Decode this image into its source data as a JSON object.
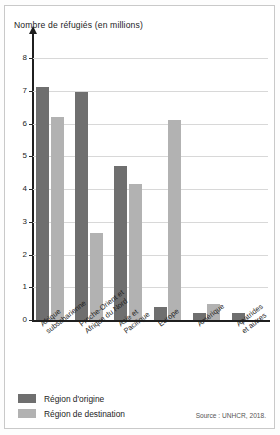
{
  "figure": {
    "source_note": "Source : UNHCR, 2018."
  },
  "legend": {
    "items": [
      {
        "label": "Région d'origine",
        "color": "#6f6f6f",
        "key": "origin"
      },
      {
        "label": "Région de destination",
        "color": "#b2b2b2",
        "key": "destination"
      }
    ]
  },
  "chart_data": {
    "type": "bar",
    "title": "Nombre de réfugiés (en millions)",
    "xlabel": "",
    "ylabel": "Nombre de réfugiés (en millions)",
    "ylim": [
      0,
      8
    ],
    "yticks": [
      0,
      1,
      2,
      3,
      4,
      5,
      6,
      7,
      8
    ],
    "ytick_labels": [
      "0",
      "1",
      "2",
      "3",
      "4",
      "5",
      "6",
      "7",
      "8"
    ],
    "grid": true,
    "legend_position": "bottom-left",
    "categories": [
      "Afrique subsaharienne",
      "Proche-Orient et Afrique du Nord",
      "Asie et Pacifique",
      "Europe",
      "Amérique",
      "Apatrides et autres"
    ],
    "category_lines": [
      [
        "Afrique",
        "subsaharienne"
      ],
      [
        "Proche-Orient et",
        "Afrique du Nord"
      ],
      [
        "Asie et",
        "Pacifique"
      ],
      [
        "Europe"
      ],
      [
        "Amérique"
      ],
      [
        "Apatrides",
        "et autres"
      ]
    ],
    "series": [
      {
        "name": "Région d'origine",
        "color": "#6f6f6f",
        "values": [
          7.1,
          6.95,
          4.7,
          0.4,
          0.2,
          0.2
        ]
      },
      {
        "name": "Région de destination",
        "color": "#b2b2b2",
        "values": [
          6.2,
          2.65,
          4.15,
          6.1,
          0.5,
          0.0
        ]
      }
    ]
  }
}
